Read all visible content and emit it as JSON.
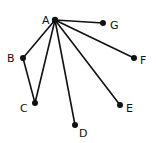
{
  "diagram": {
    "type": "graph",
    "nodes": [
      {
        "id": "A",
        "label": "A",
        "x": 55,
        "y": 20,
        "lx": 42,
        "ly": 24
      },
      {
        "id": "G",
        "label": "G",
        "x": 103,
        "y": 23,
        "lx": 110,
        "ly": 29
      },
      {
        "id": "B",
        "label": "B",
        "x": 23,
        "y": 58,
        "lx": 7,
        "ly": 62
      },
      {
        "id": "F",
        "label": "F",
        "x": 134,
        "y": 58,
        "lx": 140,
        "ly": 64
      },
      {
        "id": "C",
        "label": "C",
        "x": 35,
        "y": 103,
        "lx": 20,
        "ly": 112
      },
      {
        "id": "E",
        "label": "E",
        "x": 120,
        "y": 105,
        "lx": 126,
        "ly": 112
      },
      {
        "id": "D",
        "label": "D",
        "x": 75,
        "y": 125,
        "lx": 79,
        "ly": 137
      }
    ],
    "edges": [
      [
        "A",
        "G"
      ],
      [
        "A",
        "F"
      ],
      [
        "A",
        "E"
      ],
      [
        "A",
        "D"
      ],
      [
        "A",
        "C"
      ],
      [
        "A",
        "B"
      ],
      [
        "B",
        "C"
      ]
    ]
  }
}
